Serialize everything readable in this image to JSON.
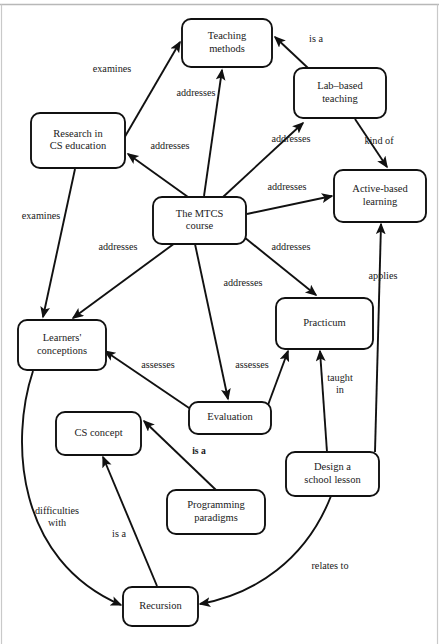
{
  "figure": {
    "kind": "concept-map",
    "width": 439,
    "height": 644,
    "background": "#ffffff",
    "ink": "#111111",
    "frame": "#c9c9c9"
  },
  "nodes": [
    {
      "id": "teaching-methods",
      "label_lines": [
        "Teaching",
        "methods"
      ],
      "x": 182,
      "y": 19,
      "w": 90,
      "h": 48
    },
    {
      "id": "lab-based-teaching",
      "label_lines": [
        "Lab–based",
        "teaching"
      ],
      "x": 294,
      "y": 68,
      "w": 92,
      "h": 50
    },
    {
      "id": "research-cs-ed",
      "label_lines": [
        "Research in",
        "CS education"
      ],
      "x": 31,
      "y": 113,
      "w": 94,
      "h": 55
    },
    {
      "id": "active-based",
      "label_lines": [
        "Active-based",
        "learning"
      ],
      "x": 334,
      "y": 170,
      "w": 92,
      "h": 52
    },
    {
      "id": "mtcs-course",
      "label_lines": [
        "The MTCS",
        "course"
      ],
      "x": 153,
      "y": 197,
      "w": 93,
      "h": 47
    },
    {
      "id": "practicum",
      "label_lines": [
        "Practicum"
      ],
      "x": 276,
      "y": 298,
      "w": 97,
      "h": 51
    },
    {
      "id": "learners-conceptions",
      "label_lines": [
        "Learners'",
        "conceptions"
      ],
      "x": 18,
      "y": 320,
      "w": 88,
      "h": 50
    },
    {
      "id": "evaluation",
      "label_lines": [
        "Evaluation"
      ],
      "x": 189,
      "y": 402,
      "w": 82,
      "h": 32
    },
    {
      "id": "cs-concept",
      "label_lines": [
        "CS concept"
      ],
      "x": 56,
      "y": 412,
      "w": 85,
      "h": 43
    },
    {
      "id": "design-school-lesson",
      "label_lines": [
        "Design a",
        "school lesson"
      ],
      "x": 286,
      "y": 452,
      "w": 93,
      "h": 44
    },
    {
      "id": "programming-paradigms",
      "label_lines": [
        "Programming",
        "paradigms"
      ],
      "x": 167,
      "y": 490,
      "w": 98,
      "h": 44
    },
    {
      "id": "recursion",
      "label_lines": [
        "Recursion"
      ],
      "x": 123,
      "y": 587,
      "w": 75,
      "h": 39
    }
  ],
  "edges": [
    {
      "id": "research-examines-teaching",
      "from": "research-cs-ed",
      "to": "teaching-methods",
      "label": "examines",
      "label_x": 112,
      "label_y": 70,
      "bold": false
    },
    {
      "id": "lab-isa-teaching",
      "from": "lab-based-teaching",
      "to": "teaching-methods",
      "label": "is a",
      "label_x": 316,
      "label_y": 40,
      "bold": false
    },
    {
      "id": "mtcs-addresses-teaching",
      "from": "mtcs-course",
      "to": "teaching-methods",
      "label": "addresses",
      "label_x": 196,
      "label_y": 94,
      "bold": false
    },
    {
      "id": "mtcs-addresses-research",
      "from": "mtcs-course",
      "to": "research-cs-ed",
      "label": "addresses",
      "label_x": 170,
      "label_y": 147,
      "bold": false
    },
    {
      "id": "mtcs-addresses-lab",
      "from": "mtcs-course",
      "to": "lab-based-teaching",
      "label": "addresses",
      "label_x": 291,
      "label_y": 140,
      "bold": false
    },
    {
      "id": "lab-kindof-active",
      "from": "lab-based-teaching",
      "to": "active-based",
      "label": "kind of",
      "label_x": 379,
      "label_y": 142,
      "bold": false
    },
    {
      "id": "mtcs-addresses-active",
      "from": "mtcs-course",
      "to": "active-based",
      "label": "addresses",
      "label_x": 287,
      "label_y": 188,
      "bold": false
    },
    {
      "id": "research-examines-learners",
      "from": "research-cs-ed",
      "to": "learners-conceptions",
      "label": "examines",
      "label_x": 41,
      "label_y": 217,
      "bold": false
    },
    {
      "id": "mtcs-addresses-learners",
      "from": "mtcs-course",
      "to": "learners-conceptions",
      "label": "addresses",
      "label_x": 118,
      "label_y": 248,
      "bold": false
    },
    {
      "id": "mtcs-addresses-evaluation",
      "from": "mtcs-course",
      "to": "evaluation",
      "label": "addresses",
      "label_x": 243,
      "label_y": 284,
      "bold": false
    },
    {
      "id": "mtcs-addresses-practicum",
      "from": "mtcs-course",
      "to": "practicum",
      "label": "addresses",
      "label_x": 291,
      "label_y": 248,
      "bold": false
    },
    {
      "id": "evaluation-assesses-learners",
      "from": "evaluation",
      "to": "learners-conceptions",
      "label": "assesses",
      "label_x": 158,
      "label_y": 366,
      "bold": false
    },
    {
      "id": "evaluation-assesses-practicum",
      "from": "evaluation",
      "to": "practicum",
      "label": "assesses",
      "label_x": 252,
      "label_y": 366,
      "bold": false
    },
    {
      "id": "design-taughtin-practicum",
      "from": "design-school-lesson",
      "to": "practicum",
      "label": "taught\nin",
      "label_x": 340,
      "label_y": 385,
      "bold": false
    },
    {
      "id": "design-applies-active",
      "from": "design-school-lesson",
      "to": "active-based",
      "label": "applies",
      "label_x": 383,
      "label_y": 277,
      "bold": false
    },
    {
      "id": "programming-isa-cs-concept",
      "from": "programming-paradigms",
      "to": "cs-concept",
      "label": "is a",
      "label_x": 199,
      "label_y": 452,
      "bold": true
    },
    {
      "id": "recursion-isa-cs-concept",
      "from": "recursion",
      "to": "cs-concept",
      "label": "is a",
      "label_x": 119,
      "label_y": 535,
      "bold": false
    },
    {
      "id": "learners-difficulties-recursion",
      "from": "learners-conceptions",
      "to": "recursion",
      "label": "difficulties\nwith",
      "label_x": 57,
      "label_y": 518,
      "bold": false
    },
    {
      "id": "design-relatesto-recursion",
      "from": "design-school-lesson",
      "to": "recursion",
      "label": "relates to",
      "label_x": 330,
      "label_y": 567,
      "bold": false
    }
  ],
  "geometry": {
    "paths": {
      "research-examines-teaching": "M 116,152 L 180,42",
      "lab-isa-teaching": "M 324,83 L 275,37",
      "mtcs-addresses-teaching": "M 204,196 L 222,70",
      "mtcs-addresses-research": "M 188,197 L 128,154",
      "mtcs-addresses-lab": "M 223,197 L 303,123",
      "lab-kindof-active": "M 355,119 L 387,167",
      "mtcs-addresses-active": "M 247,214 L 332,196",
      "research-examines-learners": "M 75,169 L 43,317",
      "mtcs-addresses-learners": "M 175,243 L 73,318",
      "mtcs-addresses-evaluation": "M 195,244 L 228,399",
      "mtcs-addresses-practicum": "M 244,237 L 316,295",
      "evaluation-assesses-learners": "M 192,410 L 105,351",
      "evaluation-assesses-practicum": "M 268,405 L 288,351",
      "design-taughtin-practicum": "M 327,452 L 320,351",
      "design-applies-active": "M 375,452 L 381,224",
      "programming-isa-cs-concept": "M 216,490 L 144,421",
      "recursion-isa-cs-concept": "M 157,586 L 103,457",
      "learners-difficulties-recursion": "M 33,371 C 10,440 16,560 121,605",
      "design-relatesto-recursion": "M 331,496 C 306,560 255,594 200,604"
    }
  }
}
